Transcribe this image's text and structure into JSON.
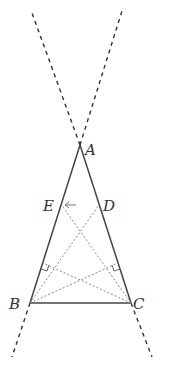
{
  "diagram": {
    "type": "geometry",
    "colors": {
      "solid": "#444444",
      "dashed": "#333333",
      "dotted": "#888888",
      "label": "#333333",
      "background": "#ffffff"
    },
    "points": {
      "A": {
        "label": "A",
        "x": 80,
        "y": 145
      },
      "B": {
        "label": "B",
        "x": 30,
        "y": 303
      },
      "C": {
        "label": "C",
        "x": 131,
        "y": 303
      },
      "D": {
        "label": "D",
        "x": 99,
        "y": 205
      },
      "E": {
        "label": "E",
        "x": 61,
        "y": 205
      },
      "F": {
        "x": 43,
        "y": 263
      },
      "G": {
        "x": 118,
        "y": 263
      }
    },
    "labels": {
      "A": "A",
      "B": "B",
      "C": "C",
      "D": "D",
      "E": "E"
    },
    "annotations": {
      "arrow_near_E": "←"
    }
  }
}
